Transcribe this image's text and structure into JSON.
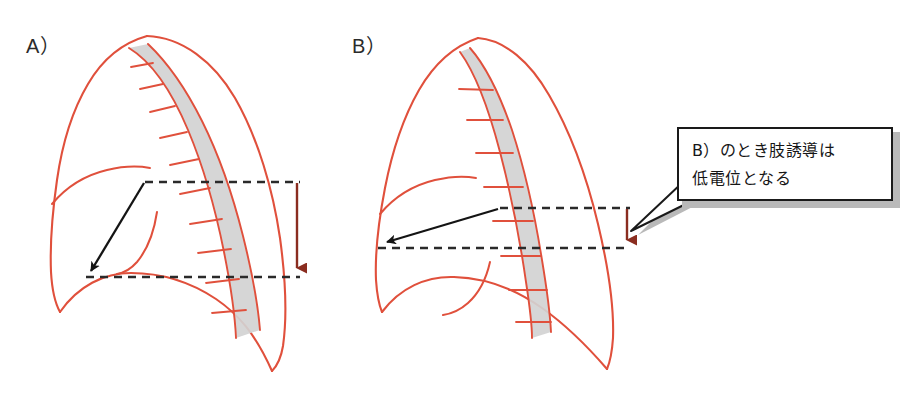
{
  "figure": {
    "panels": [
      {
        "id": "A",
        "label": "A）",
        "description": "標準体型の胸郭 — 心臓と体表の距離が大きい",
        "dashed_line_upper_y": 182,
        "dashed_line_lower_y": 277,
        "gap_label": "大きい電位差"
      },
      {
        "id": "B",
        "label": "B）",
        "description": "やせ型・肺気腫の胸郭 — 心臓と体表の距離が小さい",
        "dashed_line_upper_y": 208,
        "dashed_line_lower_y": 248,
        "gap_label": "小さい電位差"
      }
    ],
    "callout": {
      "text": "B）のとき肢誘導は\n低電位となる",
      "line1": "B）のとき肢誘導は",
      "line2": "低電位となる"
    },
    "caption": "",
    "colors": {
      "outline_red": "#e0503c",
      "band_fill_gray": "#d2d2d2",
      "measure_arrow_brown": "#8a2d20",
      "pointer_arrow_black": "#141414",
      "dashed_line": "#2a2a2a",
      "callout_border": "#1a1a1a",
      "callout_fill": "#ffffff",
      "callout_shadow": "#b9b9b9",
      "background": "#ffffff"
    }
  }
}
